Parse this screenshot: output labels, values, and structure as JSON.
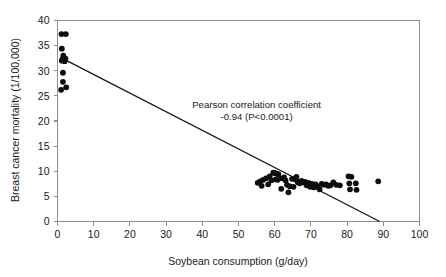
{
  "chart_data": {
    "type": "scatter",
    "title": "",
    "xlabel": "Soybean consumption (g/day)",
    "ylabel": "Breast cancer mortality (1/100,000)",
    "xlim": [
      0,
      100
    ],
    "ylim": [
      0,
      40
    ],
    "xticks": [
      0,
      10,
      20,
      30,
      40,
      50,
      60,
      70,
      80,
      90,
      100
    ],
    "yticks": [
      0,
      5,
      10,
      15,
      20,
      25,
      30,
      35,
      40
    ],
    "xtick_labels": [
      "0",
      "10",
      "20",
      "30",
      "40",
      "50",
      "60",
      "70",
      "80",
      "90",
      "100"
    ],
    "ytick_labels": [
      "0",
      "5",
      "10",
      "15",
      "20",
      "25",
      "30",
      "35",
      "40"
    ],
    "grid": false,
    "legend": null,
    "marker": "filled-circle",
    "marker_color": "#0d0d0d",
    "frame": [
      "left",
      "bottom",
      "top",
      "right"
    ],
    "annotations": [
      {
        "name": "pearson-annotation",
        "line1": "Pearson correlation coefficient",
        "line2": "-0.94 (P<0.0001)",
        "x": 55,
        "y": 22.5
      }
    ],
    "statistics": {
      "pearson_r": -0.94,
      "p_value_text": "P<0.0001"
    },
    "fit_line": {
      "name": "regression-line",
      "x_start": 2.0,
      "y_start": 32.2,
      "x_end": 89.0,
      "y_end": 0.0,
      "color": "#1a1a1a"
    },
    "points": [
      [
        1.1,
        37.3
      ],
      [
        2.3,
        37.3
      ],
      [
        1.2,
        34.4
      ],
      [
        1.6,
        33.0
      ],
      [
        1.4,
        32.3
      ],
      [
        2.2,
        32.4
      ],
      [
        1.2,
        32.0
      ],
      [
        2.0,
        31.9
      ],
      [
        1.5,
        29.6
      ],
      [
        1.5,
        27.8
      ],
      [
        1.0,
        26.2
      ],
      [
        2.4,
        26.7
      ],
      [
        55.3,
        7.7
      ],
      [
        56.0,
        8.0
      ],
      [
        56.4,
        7.1
      ],
      [
        56.8,
        8.3
      ],
      [
        57.6,
        8.6
      ],
      [
        58.2,
        7.4
      ],
      [
        58.6,
        9.0
      ],
      [
        59.1,
        8.2
      ],
      [
        59.6,
        9.7
      ],
      [
        60.2,
        9.6
      ],
      [
        60.3,
        8.4
      ],
      [
        60.8,
        8.3
      ],
      [
        61.0,
        9.4
      ],
      [
        61.4,
        8.6
      ],
      [
        61.8,
        6.5
      ],
      [
        62.3,
        8.6
      ],
      [
        62.6,
        8.8
      ],
      [
        63.0,
        8.2
      ],
      [
        63.4,
        7.3
      ],
      [
        63.8,
        5.8
      ],
      [
        64.2,
        7.0
      ],
      [
        64.8,
        8.5
      ],
      [
        65.2,
        6.9
      ],
      [
        65.6,
        8.4
      ],
      [
        66.0,
        8.9
      ],
      [
        66.4,
        7.8
      ],
      [
        66.9,
        7.6
      ],
      [
        67.4,
        8.1
      ],
      [
        67.8,
        7.8
      ],
      [
        68.4,
        7.9
      ],
      [
        68.8,
        7.2
      ],
      [
        69.3,
        7.7
      ],
      [
        69.8,
        6.9
      ],
      [
        70.3,
        7.5
      ],
      [
        70.8,
        6.8
      ],
      [
        71.3,
        7.4
      ],
      [
        71.9,
        7.0
      ],
      [
        72.4,
        6.4
      ],
      [
        73.0,
        7.5
      ],
      [
        73.6,
        7.3
      ],
      [
        74.2,
        7.4
      ],
      [
        74.8,
        7.1
      ],
      [
        75.4,
        7.2
      ],
      [
        76.2,
        7.8
      ],
      [
        77.0,
        7.3
      ],
      [
        78.0,
        7.2
      ],
      [
        80.4,
        9.0
      ],
      [
        80.6,
        7.6
      ],
      [
        80.8,
        6.4
      ],
      [
        81.2,
        8.9
      ],
      [
        82.4,
        7.6
      ],
      [
        82.6,
        6.3
      ],
      [
        88.6,
        8.0
      ]
    ]
  },
  "axes": {
    "x_axis_name": "x-axis",
    "y_axis_name": "y-axis"
  }
}
